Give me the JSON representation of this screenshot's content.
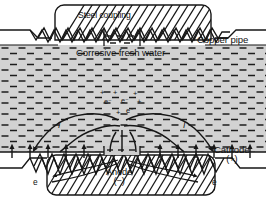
{
  "figure": {
    "name": "galvanic-corrosion-steel-coupling-copper-pipe",
    "width": 266,
    "height": 199
  },
  "labels": {
    "steel_coupling": "Steel coupling",
    "copper_pipe": "Copper pipe",
    "corrosive_water": "Corrosive fresh water",
    "cathode": "Cathode",
    "cathode_sign": "(+)",
    "anode": "Anode",
    "anode_sign": "(−)",
    "electron_left": "e",
    "electron_right": "e"
  },
  "current_labels": [
    {
      "text": "I"
    },
    {
      "text": "I"
    }
  ],
  "ions": [
    {
      "text": "e⁻"
    },
    {
      "text": "e⁻"
    },
    {
      "text": "e⁻"
    },
    {
      "text": "+"
    },
    {
      "text": "+"
    },
    {
      "text": "+"
    },
    {
      "text": "+"
    },
    {
      "text": "+"
    }
  ],
  "colors": {
    "water_fill": "#d2d2d2",
    "metal_fill": "#c9c9c9",
    "line": "#161616",
    "background": "#ffffff",
    "dash_mark": "#1c1c1c"
  },
  "geometry": {
    "water_top_y": 45,
    "water_bottom_y": 152,
    "coupling_left_x": 52,
    "coupling_right_x": 215,
    "anode_gap_left_x": 104,
    "anode_gap_right_x": 140
  }
}
